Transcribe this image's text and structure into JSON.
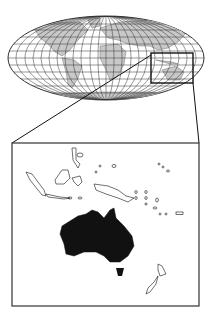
{
  "figure": {
    "world_map": {
      "projection": "elliptical graticule",
      "land_fill": "#c8c8c8",
      "ocean_fill": "#ffffff",
      "grid_color": "#333333"
    },
    "highlight_box": {
      "label": "Oceania region",
      "stroke": "#111111"
    },
    "inset": {
      "label": "Oceania inset",
      "highlighted_region": "Australia",
      "highlight_fill": "#111111",
      "outline_color": "#111111"
    }
  }
}
